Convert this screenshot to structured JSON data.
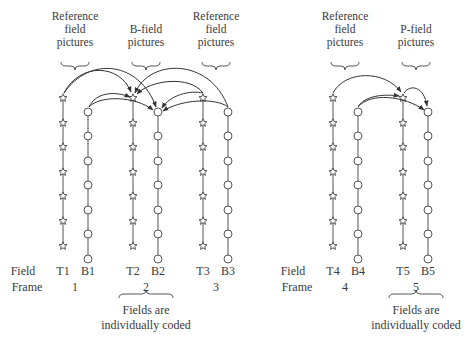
{
  "left_diagram": {
    "group_labels": [
      {
        "text_lines": [
          "Reference",
          "field",
          "pictures"
        ],
        "x": 75
      },
      {
        "text_lines": [
          "B-field",
          "pictures"
        ],
        "x": 146
      },
      {
        "text_lines": [
          "Reference",
          "field",
          "pictures"
        ],
        "x": 216
      }
    ],
    "row_labels": {
      "field": "Field",
      "frame": "Frame"
    },
    "fields": [
      {
        "label": "T1",
        "x": 63,
        "type": "star"
      },
      {
        "label": "B1",
        "x": 88,
        "type": "circle"
      },
      {
        "label": "T2",
        "x": 133,
        "type": "star"
      },
      {
        "label": "B2",
        "x": 158,
        "type": "circle"
      },
      {
        "label": "T3",
        "x": 203,
        "type": "star"
      },
      {
        "label": "B3",
        "x": 228,
        "type": "circle"
      }
    ],
    "frames": [
      {
        "label": "1",
        "x": 75
      },
      {
        "label": "2",
        "x": 146
      },
      {
        "label": "3",
        "x": 216
      }
    ],
    "bottom_note": {
      "line1": "Fields are",
      "line2": "individually coded",
      "x": 146
    }
  },
  "right_diagram": {
    "group_labels": [
      {
        "text_lines": [
          "Reference",
          "field",
          "pictures"
        ],
        "x": 345
      },
      {
        "text_lines": [
          "P-field",
          "pictures"
        ],
        "x": 416
      }
    ],
    "row_labels": {
      "field": "Field",
      "frame": "Frame"
    },
    "fields": [
      {
        "label": "T4",
        "x": 333,
        "type": "star"
      },
      {
        "label": "B4",
        "x": 358,
        "type": "circle"
      },
      {
        "label": "T5",
        "x": 403,
        "type": "star"
      },
      {
        "label": "B5",
        "x": 428,
        "type": "circle"
      }
    ],
    "frames": [
      {
        "label": "4",
        "x": 345
      },
      {
        "label": "5",
        "x": 416
      }
    ],
    "bottom_note": {
      "line1": "Fields are",
      "line2": "individually coded",
      "x": 416
    }
  }
}
